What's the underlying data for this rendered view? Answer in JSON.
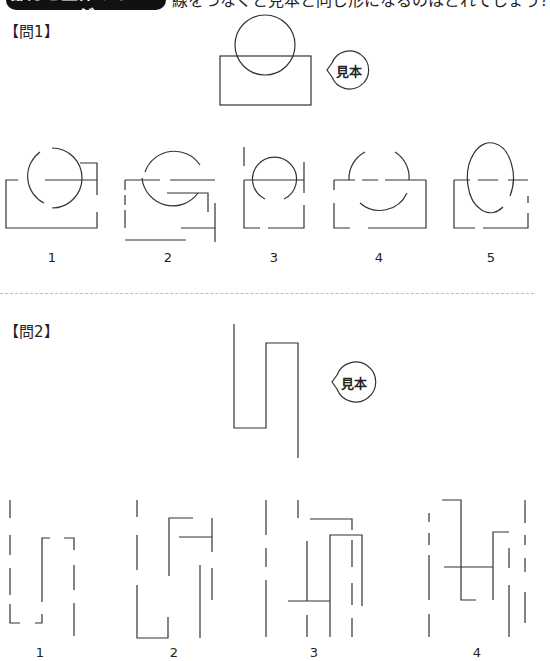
{
  "header": {
    "category_label": "部分と全体のイメージ",
    "instruction": "線をつなぐと見本と同じ形になるのはどれでしょう？"
  },
  "questions": [
    {
      "label": "【問1】",
      "sample_label": "見本",
      "sample_description": "rectangle overlapped by a circle on its top edge",
      "options": [
        {
          "number": "1"
        },
        {
          "number": "2"
        },
        {
          "number": "3"
        },
        {
          "number": "4"
        },
        {
          "number": "5"
        }
      ]
    },
    {
      "label": "【問2】",
      "sample_label": "見本",
      "sample_description": "continuous zig-zag line: down, right, up, right, down",
      "options": [
        {
          "number": "1"
        },
        {
          "number": "2"
        },
        {
          "number": "3"
        },
        {
          "number": "4"
        }
      ]
    }
  ],
  "colors": {
    "line": "#333333",
    "title_background": "#111111",
    "title_text": "#ffffff",
    "divider": "#bdbdbd"
  }
}
